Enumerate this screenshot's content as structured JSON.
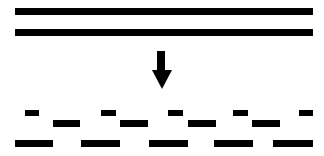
{
  "diagram": {
    "description": "Two continuous horizontal lines transform (downward arrow) into staggered broken dash segments",
    "colors": {
      "background": "#ffffff",
      "foreground": "#000000"
    },
    "continuous_lines": [
      {
        "x": 15,
        "y": 8,
        "w": 298,
        "h": 7
      },
      {
        "x": 15,
        "y": 29,
        "w": 298,
        "h": 7
      }
    ],
    "arrow": {
      "direction": "down",
      "icon": "arrow-down-icon",
      "shaft": {
        "x": 157,
        "y": 51,
        "w": 8,
        "h": 20
      },
      "head": {
        "left": 152,
        "right": 172,
        "top": 70,
        "tip_x": 162,
        "tip_y": 89
      }
    },
    "dashed_rows": [
      {
        "name": "short-dashes",
        "segments": [
          {
            "x": 25,
            "y": 110,
            "w": 14,
            "h": 6
          },
          {
            "x": 101,
            "y": 110,
            "w": 15,
            "h": 6
          },
          {
            "x": 168,
            "y": 110,
            "w": 15,
            "h": 6
          },
          {
            "x": 233,
            "y": 110,
            "w": 15,
            "h": 6
          },
          {
            "x": 299,
            "y": 110,
            "w": 14,
            "h": 6
          }
        ]
      },
      {
        "name": "medium-dashes",
        "segments": [
          {
            "x": 53,
            "y": 120,
            "w": 27,
            "h": 7
          },
          {
            "x": 120,
            "y": 120,
            "w": 28,
            "h": 7
          },
          {
            "x": 188,
            "y": 120,
            "w": 28,
            "h": 7
          },
          {
            "x": 252,
            "y": 120,
            "w": 28,
            "h": 7
          }
        ]
      },
      {
        "name": "long-dashes",
        "segments": [
          {
            "x": 15,
            "y": 140,
            "w": 38,
            "h": 7
          },
          {
            "x": 81,
            "y": 140,
            "w": 39,
            "h": 7
          },
          {
            "x": 149,
            "y": 140,
            "w": 39,
            "h": 7
          },
          {
            "x": 214,
            "y": 140,
            "w": 39,
            "h": 7
          },
          {
            "x": 273,
            "y": 140,
            "w": 40,
            "h": 7
          }
        ]
      }
    ]
  }
}
